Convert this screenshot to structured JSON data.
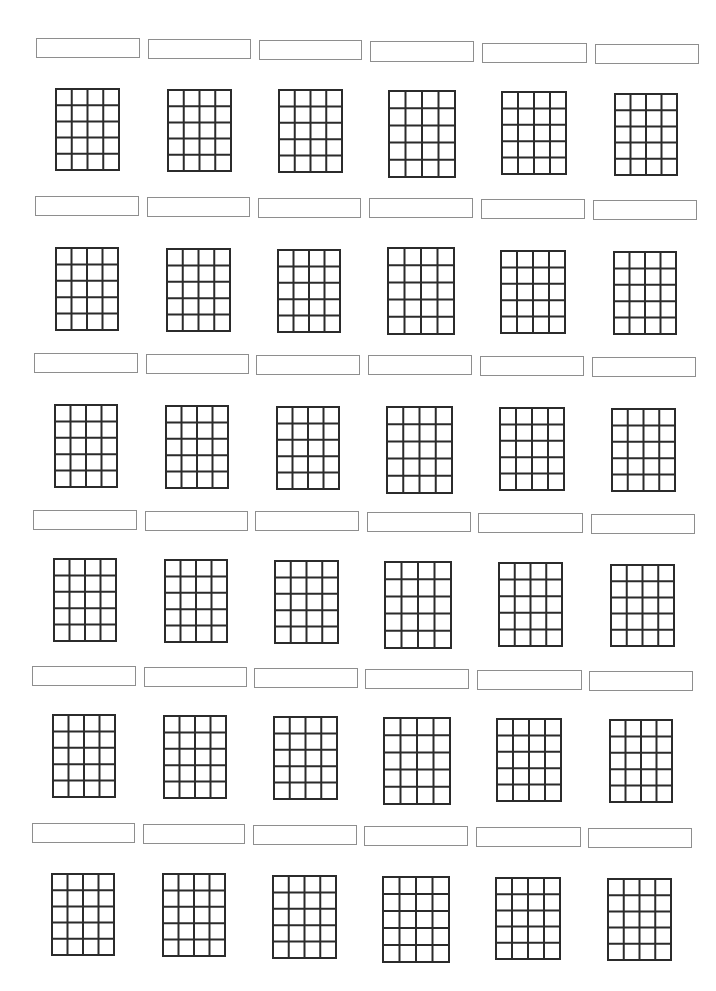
{
  "document": {
    "type": "blank chord chart sheet",
    "rows": 6,
    "columns": 6,
    "grid_spec": {
      "strings": 5,
      "fret_lines": 6,
      "cell_columns": 4,
      "cell_rows": 5
    },
    "colors": {
      "box_border": "#8e8e8e",
      "grid_line": "#2b2b2b",
      "background": "#ffffff"
    }
  },
  "charts": [
    {
      "row": 0,
      "col": 0,
      "label": "",
      "box": [
        36,
        38,
        104,
        20
      ],
      "grid": [
        55,
        88,
        65,
        83
      ]
    },
    {
      "row": 0,
      "col": 1,
      "label": "",
      "box": [
        148,
        39,
        103,
        20
      ],
      "grid": [
        167,
        89,
        65,
        83
      ]
    },
    {
      "row": 0,
      "col": 2,
      "label": "",
      "box": [
        259,
        40,
        103,
        20
      ],
      "grid": [
        278,
        89,
        65,
        84
      ]
    },
    {
      "row": 0,
      "col": 3,
      "label": "",
      "box": [
        370,
        41,
        104,
        21
      ],
      "grid": [
        388,
        90,
        68,
        88
      ]
    },
    {
      "row": 0,
      "col": 4,
      "label": "",
      "box": [
        482,
        43,
        105,
        20
      ],
      "grid": [
        501,
        91,
        66,
        84
      ]
    },
    {
      "row": 0,
      "col": 5,
      "label": "",
      "box": [
        595,
        44,
        104,
        20
      ],
      "grid": [
        614,
        93,
        64,
        83
      ]
    },
    {
      "row": 1,
      "col": 0,
      "label": "",
      "box": [
        35,
        196,
        104,
        20
      ],
      "grid": [
        55,
        247,
        64,
        84
      ]
    },
    {
      "row": 1,
      "col": 1,
      "label": "",
      "box": [
        147,
        197,
        103,
        20
      ],
      "grid": [
        166,
        248,
        65,
        84
      ]
    },
    {
      "row": 1,
      "col": 2,
      "label": "",
      "box": [
        258,
        198,
        103,
        20
      ],
      "grid": [
        277,
        249,
        64,
        84
      ]
    },
    {
      "row": 1,
      "col": 3,
      "label": "",
      "box": [
        369,
        198,
        104,
        20
      ],
      "grid": [
        387,
        247,
        68,
        88
      ]
    },
    {
      "row": 1,
      "col": 4,
      "label": "",
      "box": [
        481,
        199,
        104,
        20
      ],
      "grid": [
        500,
        250,
        66,
        84
      ]
    },
    {
      "row": 1,
      "col": 5,
      "label": "",
      "box": [
        593,
        200,
        104,
        20
      ],
      "grid": [
        613,
        251,
        64,
        84
      ]
    },
    {
      "row": 2,
      "col": 0,
      "label": "",
      "box": [
        34,
        353,
        104,
        20
      ],
      "grid": [
        54,
        404,
        64,
        84
      ]
    },
    {
      "row": 2,
      "col": 1,
      "label": "",
      "box": [
        146,
        354,
        103,
        20
      ],
      "grid": [
        165,
        405,
        64,
        84
      ]
    },
    {
      "row": 2,
      "col": 2,
      "label": "",
      "box": [
        256,
        355,
        104,
        20
      ],
      "grid": [
        276,
        406,
        64,
        84
      ]
    },
    {
      "row": 2,
      "col": 3,
      "label": "",
      "box": [
        368,
        355,
        104,
        20
      ],
      "grid": [
        386,
        406,
        67,
        88
      ]
    },
    {
      "row": 2,
      "col": 4,
      "label": "",
      "box": [
        480,
        356,
        104,
        20
      ],
      "grid": [
        499,
        407,
        66,
        84
      ]
    },
    {
      "row": 2,
      "col": 5,
      "label": "",
      "box": [
        592,
        357,
        104,
        20
      ],
      "grid": [
        611,
        408,
        65,
        84
      ]
    },
    {
      "row": 3,
      "col": 0,
      "label": "",
      "box": [
        33,
        510,
        104,
        20
      ],
      "grid": [
        53,
        558,
        64,
        84
      ]
    },
    {
      "row": 3,
      "col": 1,
      "label": "",
      "box": [
        145,
        511,
        103,
        20
      ],
      "grid": [
        164,
        559,
        64,
        84
      ]
    },
    {
      "row": 3,
      "col": 2,
      "label": "",
      "box": [
        255,
        511,
        104,
        20
      ],
      "grid": [
        274,
        560,
        65,
        84
      ]
    },
    {
      "row": 3,
      "col": 3,
      "label": "",
      "box": [
        367,
        512,
        104,
        20
      ],
      "grid": [
        384,
        561,
        68,
        88
      ]
    },
    {
      "row": 3,
      "col": 4,
      "label": "",
      "box": [
        478,
        513,
        105,
        20
      ],
      "grid": [
        498,
        562,
        65,
        85
      ]
    },
    {
      "row": 3,
      "col": 5,
      "label": "",
      "box": [
        591,
        514,
        104,
        20
      ],
      "grid": [
        610,
        564,
        65,
        83
      ]
    },
    {
      "row": 4,
      "col": 0,
      "label": "",
      "box": [
        32,
        666,
        104,
        20
      ],
      "grid": [
        52,
        714,
        64,
        84
      ]
    },
    {
      "row": 4,
      "col": 1,
      "label": "",
      "box": [
        144,
        667,
        103,
        20
      ],
      "grid": [
        163,
        715,
        64,
        84
      ]
    },
    {
      "row": 4,
      "col": 2,
      "label": "",
      "box": [
        254,
        668,
        104,
        20
      ],
      "grid": [
        273,
        716,
        65,
        84
      ]
    },
    {
      "row": 4,
      "col": 3,
      "label": "",
      "box": [
        365,
        669,
        104,
        20
      ],
      "grid": [
        383,
        717,
        68,
        88
      ]
    },
    {
      "row": 4,
      "col": 4,
      "label": "",
      "box": [
        477,
        670,
        105,
        20
      ],
      "grid": [
        496,
        718,
        66,
        84
      ]
    },
    {
      "row": 4,
      "col": 5,
      "label": "",
      "box": [
        589,
        671,
        104,
        20
      ],
      "grid": [
        609,
        719,
        64,
        84
      ]
    },
    {
      "row": 5,
      "col": 0,
      "label": "",
      "box": [
        32,
        823,
        103,
        20
      ],
      "grid": [
        51,
        873,
        64,
        83
      ]
    },
    {
      "row": 5,
      "col": 1,
      "label": "",
      "box": [
        143,
        824,
        102,
        20
      ],
      "grid": [
        162,
        873,
        64,
        84
      ]
    },
    {
      "row": 5,
      "col": 2,
      "label": "",
      "box": [
        253,
        825,
        104,
        20
      ],
      "grid": [
        272,
        875,
        65,
        84
      ]
    },
    {
      "row": 5,
      "col": 3,
      "label": "",
      "box": [
        364,
        826,
        104,
        20
      ],
      "grid": [
        382,
        876,
        68,
        87
      ]
    },
    {
      "row": 5,
      "col": 4,
      "label": "",
      "box": [
        476,
        827,
        105,
        20
      ],
      "grid": [
        495,
        877,
        66,
        83
      ]
    },
    {
      "row": 5,
      "col": 5,
      "label": "",
      "box": [
        588,
        828,
        104,
        20
      ],
      "grid": [
        607,
        878,
        65,
        83
      ]
    }
  ]
}
